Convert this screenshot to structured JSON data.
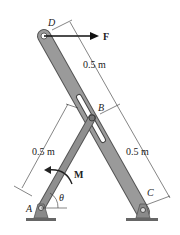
{
  "diagram": {
    "points": {
      "A": "A",
      "B": "B",
      "C": "C",
      "D": "D"
    },
    "force_label": "F",
    "moment_label": "M",
    "angle_label": "θ",
    "dimensions": {
      "DB": "0.5 m",
      "AB": "0.5 m",
      "BC": "0.5 m"
    },
    "colors": {
      "member_fill": "#8a8a8a",
      "member_edge": "#555555",
      "dim_line": "#333333",
      "arrow": "#111111"
    }
  }
}
